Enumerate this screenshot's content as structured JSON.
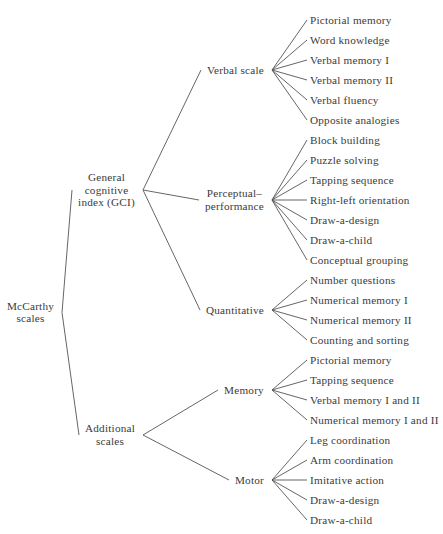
{
  "diagram": {
    "type": "tree",
    "orientation": "left-to-right",
    "background_color": "#ffffff",
    "line_color": "#555555",
    "text_color": "#3a3a3a",
    "root": {
      "id": "mccarthy-scales",
      "label": "McCarthy\nscales",
      "lines": [
        "McCarthy",
        "scales"
      ]
    },
    "branches": [
      {
        "id": "general-cognitive-index",
        "label": "General\ncognitive\nindex (GCI)",
        "lines": [
          "General",
          "cognitive",
          "index (GCI)"
        ],
        "children": [
          {
            "id": "verbal-scale",
            "label": "Verbal scale",
            "lines": [
              "Verbal scale"
            ],
            "leaves": [
              "Pictorial memory",
              "Word knowledge",
              "Verbal memory I",
              "Verbal memory II",
              "Verbal fluency",
              "Opposite analogies"
            ]
          },
          {
            "id": "perceptual-performance",
            "label": "Perceptual–\nperformance",
            "lines": [
              "Perceptual–",
              "performance"
            ],
            "leaves": [
              "Block building",
              "Puzzle solving",
              "Tapping sequence",
              "Right-left orientation",
              "Draw-a-design",
              "Draw-a-child",
              "Conceptual grouping"
            ]
          },
          {
            "id": "quantitative",
            "label": "Quantitative",
            "lines": [
              "Quantitative"
            ],
            "leaves": [
              "Number questions",
              "Numerical memory I",
              "Numerical memory II",
              "Counting and sorting"
            ]
          }
        ]
      },
      {
        "id": "additional-scales",
        "label": "Additional\nscales",
        "lines": [
          "Additional",
          "scales"
        ],
        "children": [
          {
            "id": "memory",
            "label": "Memory",
            "lines": [
              "Memory"
            ],
            "leaves": [
              "Pictorial memory",
              "Tapping sequence",
              "Verbal memory I and II",
              "Numerical memory I and II"
            ]
          },
          {
            "id": "motor",
            "label": "Motor",
            "lines": [
              "Motor"
            ],
            "leaves": [
              "Leg coordination",
              "Arm coordination",
              "Imitative action",
              "Draw-a-design",
              "Draw-a-child"
            ]
          }
        ]
      }
    ]
  }
}
